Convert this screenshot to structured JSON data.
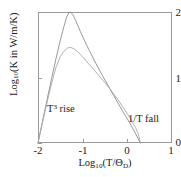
{
  "chart_data": {
    "type": "line",
    "title": "",
    "subtitle": "",
    "xlabel_text": "Log",
    "xlabel_sub": "10",
    "xlabel_tail": "(T/Θ",
    "xlabel_tail_sub": "D",
    "xlabel_close": ")",
    "ylabel_text": "Log",
    "ylabel_sub": "10",
    "ylabel_tail": "(K in W/m/K)",
    "xlim": [
      -2,
      1
    ],
    "ylim": [
      0,
      2
    ],
    "grid": false,
    "legend": "none",
    "xticks": [
      -2,
      -1,
      0,
      1
    ],
    "xtick_labels": [
      "-2",
      "-1",
      "0",
      "1"
    ],
    "yticks": [
      0,
      1,
      2
    ],
    "ytick_labels": [
      "0",
      "1",
      "2"
    ],
    "annotations": [
      {
        "name": "t-cubed-rise",
        "prefix": "T",
        "sup": "3",
        "suffix": " rise",
        "x": -1.75,
        "y": 0.62
      },
      {
        "name": "one-over-t-fall",
        "prefix": "1/T fall",
        "sup": "",
        "suffix": "",
        "x": 0.02,
        "y": 0.47
      }
    ],
    "series": [
      {
        "name": "high-purity-crystal",
        "color": "#8c8c8c",
        "points": [
          [
            -2.0,
            0.0
          ],
          [
            -1.9,
            0.33
          ],
          [
            -1.8,
            0.65
          ],
          [
            -1.7,
            0.97
          ],
          [
            -1.6,
            1.28
          ],
          [
            -1.5,
            1.57
          ],
          [
            -1.42,
            1.78
          ],
          [
            -1.36,
            1.92
          ],
          [
            -1.31,
            1.99
          ],
          [
            -1.27,
            2.0
          ],
          [
            -1.22,
            1.96
          ],
          [
            -1.15,
            1.86
          ],
          [
            -1.05,
            1.7
          ],
          [
            -0.95,
            1.55
          ],
          [
            -0.85,
            1.41
          ],
          [
            -0.7,
            1.21
          ],
          [
            -0.55,
            1.02
          ],
          [
            -0.4,
            0.84
          ],
          [
            -0.25,
            0.66
          ],
          [
            -0.1,
            0.48
          ],
          [
            0.05,
            0.31
          ],
          [
            0.18,
            0.15
          ],
          [
            0.29,
            0.0
          ]
        ]
      },
      {
        "name": "defected-crystal",
        "color": "#a8a8a8",
        "points": [
          [
            -2.0,
            0.0
          ],
          [
            -1.9,
            0.31
          ],
          [
            -1.8,
            0.61
          ],
          [
            -1.7,
            0.9
          ],
          [
            -1.6,
            1.15
          ],
          [
            -1.5,
            1.32
          ],
          [
            -1.42,
            1.4
          ],
          [
            -1.34,
            1.45
          ],
          [
            -1.27,
            1.46
          ],
          [
            -1.2,
            1.44
          ],
          [
            -1.12,
            1.4
          ],
          [
            -1.02,
            1.33
          ],
          [
            -0.92,
            1.25
          ],
          [
            -0.8,
            1.16
          ],
          [
            -0.65,
            1.04
          ],
          [
            -0.5,
            0.92
          ],
          [
            -0.35,
            0.79
          ],
          [
            -0.2,
            0.65
          ],
          [
            -0.05,
            0.5
          ],
          [
            0.08,
            0.36
          ],
          [
            0.18,
            0.24
          ],
          [
            0.25,
            0.13
          ],
          [
            0.29,
            0.0
          ]
        ]
      }
    ]
  },
  "axes": {
    "frame_color": "#9a9a9a",
    "text_color": "#1a1a1a"
  }
}
